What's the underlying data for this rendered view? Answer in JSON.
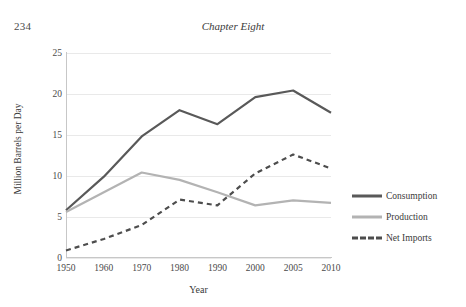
{
  "page": {
    "folio": "234",
    "running_head": "Chapter Eight"
  },
  "legend": {
    "position": "right",
    "items": [
      {
        "label": "Consumption",
        "style": "solid-thick",
        "color": "#595959"
      },
      {
        "label": "Production",
        "style": "solid-thick",
        "color": "#b3b3b3"
      },
      {
        "label": "Net Imports",
        "style": "dashed",
        "color": "#4d4d4d"
      }
    ]
  },
  "chart_data": {
    "type": "line",
    "title": "",
    "xlabel": "Year",
    "ylabel": "Million Barrels per Day",
    "categories": [
      "1950",
      "1960",
      "1970",
      "1980",
      "1990",
      "2000",
      "2005",
      "2010"
    ],
    "ytick_labels": [
      "0",
      "5",
      "10",
      "15",
      "20",
      "25"
    ],
    "yticks": [
      0,
      5,
      10,
      15,
      20,
      25
    ],
    "ylim": [
      0,
      25
    ],
    "grid": "horizontal",
    "series": [
      {
        "name": "Consumption",
        "color": "#595959",
        "dash": "none",
        "width": 2.2,
        "values": [
          5.7,
          9.8,
          14.7,
          17.9,
          16.2,
          19.5,
          20.3,
          17.6
        ]
      },
      {
        "name": "Production",
        "color": "#b3b3b3",
        "dash": "none",
        "width": 2.2,
        "values": [
          5.5,
          7.9,
          10.3,
          9.4,
          7.9,
          6.3,
          6.9,
          6.6
        ]
      },
      {
        "name": "Net Imports",
        "color": "#4d4d4d",
        "dash": "dashed",
        "width": 2.2,
        "values": [
          0.8,
          2.2,
          3.9,
          7.0,
          6.3,
          10.2,
          12.5,
          10.8
        ]
      }
    ]
  }
}
